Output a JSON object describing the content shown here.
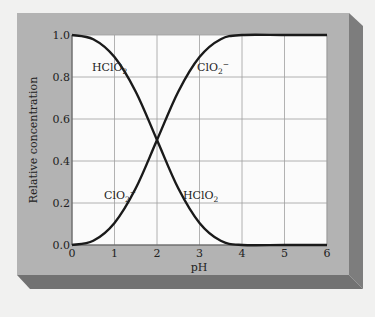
{
  "chart_data": {
    "type": "line",
    "title": "",
    "xlabel": "pH",
    "ylabel": "Relative concentration",
    "xlim": [
      0,
      6
    ],
    "ylim": [
      0.0,
      1.0
    ],
    "x_ticks": [
      "0",
      "1",
      "2",
      "3",
      "4",
      "5",
      "6"
    ],
    "y_ticks": [
      "0.0",
      "0.2",
      "0.4",
      "0.6",
      "0.8",
      "1.0"
    ],
    "grid": true,
    "legend": "none (inline curve labels)",
    "x": [
      0,
      0.5,
      1,
      1.5,
      2,
      2.5,
      3,
      3.5,
      4,
      5,
      6
    ],
    "series": [
      {
        "name": "HClO2",
        "values": [
          1.0,
          0.98,
          0.895,
          0.73,
          0.5,
          0.27,
          0.105,
          0.02,
          0.0,
          0.0,
          0.0
        ]
      },
      {
        "name": "ClO2-",
        "values": [
          0.0,
          0.02,
          0.105,
          0.27,
          0.5,
          0.73,
          0.895,
          0.98,
          1.0,
          1.0,
          1.0
        ]
      }
    ],
    "annotations": [
      {
        "text": "HClO2",
        "near": "pH 0.6, 0.83"
      },
      {
        "text": "ClO2-",
        "near": "pH 3.0, 0.83"
      },
      {
        "text": "ClO2-",
        "near": "pH 1.0, 0.17"
      },
      {
        "text": "HClO2",
        "near": "pH 2.6, 0.17"
      }
    ]
  },
  "labels": {
    "xlabel": "pH",
    "ylabel": "Relative concentration",
    "hclo2_base": "HClO",
    "hclo2_sub": "2",
    "clo2_base": "ClO",
    "clo2_sub": "2",
    "clo2_sup": "−"
  },
  "colors": {
    "background": "#f1f1f0",
    "panel": "#b3b3b3",
    "panel_side": "#7c7c7c",
    "panel_bottom": "#767676",
    "plot_bg": "#fbfbfb",
    "grid": "#9a9a9a",
    "curve": "#1a1a1a"
  }
}
